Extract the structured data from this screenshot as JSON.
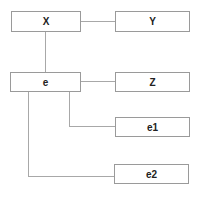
{
  "diagram": {
    "type": "tree",
    "nodes": [
      {
        "id": "X",
        "label": "X"
      },
      {
        "id": "Y",
        "label": "Y"
      },
      {
        "id": "e",
        "label": "e"
      },
      {
        "id": "Z",
        "label": "Z"
      },
      {
        "id": "e1",
        "label": "e1"
      },
      {
        "id": "e2",
        "label": "e2"
      }
    ],
    "edges": [
      {
        "from": "X",
        "to": "Y"
      },
      {
        "from": "X",
        "to": "e"
      },
      {
        "from": "e",
        "to": "Z"
      },
      {
        "from": "e",
        "to": "e1"
      },
      {
        "from": "e",
        "to": "e2"
      }
    ]
  }
}
